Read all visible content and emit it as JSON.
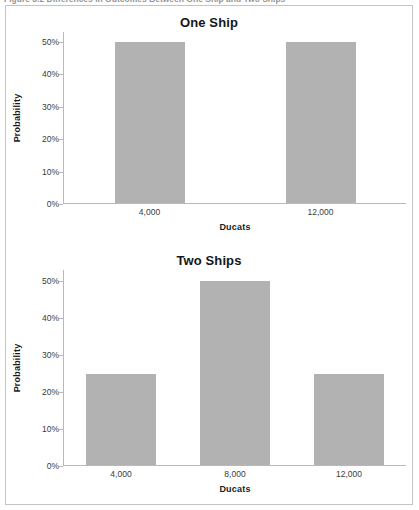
{
  "figure": {
    "caption": "Figure 3.2    Differences in Outcomes Between One Ship and Two Ships",
    "border_color": "#c4c4c4",
    "bar_color": "#b2b2b2",
    "axis_color": "#b9b9b9"
  },
  "chart_data": [
    {
      "type": "bar",
      "title": "One Ship",
      "xlabel": "Ducats",
      "ylabel": "Probability",
      "categories": [
        "4,000",
        "12,000"
      ],
      "values": [
        50,
        50
      ],
      "ytick_labels": [
        "0%",
        "10%",
        "20%",
        "30%",
        "40%",
        "50%"
      ],
      "ytick_values": [
        0,
        10,
        20,
        30,
        40,
        50
      ],
      "ylim": [
        0,
        53
      ],
      "grid": false,
      "legend": "none",
      "value_unit": "percent"
    },
    {
      "type": "bar",
      "title": "Two Ships",
      "xlabel": "Ducats",
      "ylabel": "Probability",
      "categories": [
        "4,000",
        "8,000",
        "12,000"
      ],
      "values": [
        25,
        50,
        25
      ],
      "ytick_labels": [
        "0%",
        "10%",
        "20%",
        "30%",
        "40%",
        "50%"
      ],
      "ytick_values": [
        0,
        10,
        20,
        30,
        40,
        50
      ],
      "ylim": [
        0,
        53
      ],
      "grid": false,
      "legend": "none",
      "value_unit": "percent"
    }
  ]
}
